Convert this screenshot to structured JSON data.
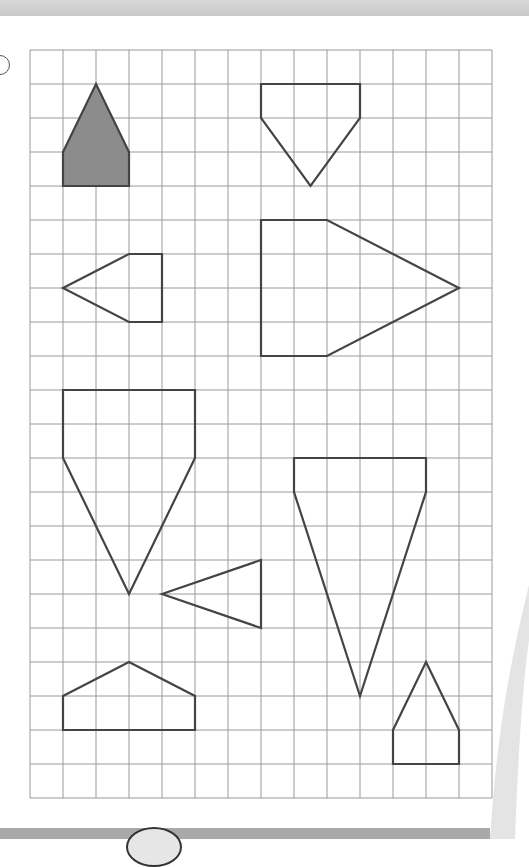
{
  "exercise": {
    "label_marker": "",
    "grid": {
      "origin_x": 30,
      "origin_y": 50,
      "cell_w": 33,
      "cell_h": 34,
      "cols": 14,
      "rows": 22,
      "line_color": "#9a9a9a"
    },
    "shape_stroke": "#444444",
    "shaded_fill": "#8c8c8c",
    "shapes": [
      {
        "name": "shaded-house",
        "shaded": true,
        "points": [
          [
            2,
            1
          ],
          [
            3,
            3
          ],
          [
            3,
            4
          ],
          [
            1,
            4
          ],
          [
            1,
            3
          ]
        ]
      },
      {
        "name": "down-pentagon-small",
        "shaded": false,
        "points": [
          [
            7,
            1
          ],
          [
            10,
            1
          ],
          [
            10,
            2
          ],
          [
            8.5,
            4
          ],
          [
            7,
            2
          ]
        ]
      },
      {
        "name": "left-pentagon-small",
        "shaded": false,
        "points": [
          [
            1,
            7
          ],
          [
            3,
            6
          ],
          [
            4,
            6
          ],
          [
            4,
            8
          ],
          [
            3,
            8
          ]
        ]
      },
      {
        "name": "right-pentagon-large",
        "shaded": false,
        "points": [
          [
            7,
            5
          ],
          [
            9,
            5
          ],
          [
            13,
            7
          ],
          [
            9,
            9
          ],
          [
            7,
            9
          ]
        ]
      },
      {
        "name": "down-pentagon-large",
        "shaded": false,
        "points": [
          [
            1,
            10
          ],
          [
            5,
            10
          ],
          [
            5,
            12
          ],
          [
            3,
            16
          ],
          [
            1,
            12
          ]
        ]
      },
      {
        "name": "left-triangle",
        "shaded": false,
        "points": [
          [
            4,
            16
          ],
          [
            7,
            15
          ],
          [
            7,
            17
          ]
        ]
      },
      {
        "name": "down-pentagon-tall",
        "shaded": false,
        "points": [
          [
            8,
            12
          ],
          [
            12,
            12
          ],
          [
            12,
            13
          ],
          [
            10,
            19
          ],
          [
            8,
            13
          ]
        ]
      },
      {
        "name": "house-wide",
        "shaded": false,
        "points": [
          [
            1,
            19
          ],
          [
            3,
            18
          ],
          [
            5,
            19
          ],
          [
            5,
            20
          ],
          [
            1,
            20
          ]
        ]
      },
      {
        "name": "house-small",
        "shaded": false,
        "points": [
          [
            12,
            18
          ],
          [
            13,
            20
          ],
          [
            13,
            21
          ],
          [
            11,
            21
          ],
          [
            11,
            20
          ]
        ]
      }
    ]
  },
  "colors": {
    "top_strip": "#cfcfcf",
    "bottom_bar": "#a9a9a9",
    "swoosh": "#e4e4e4"
  }
}
